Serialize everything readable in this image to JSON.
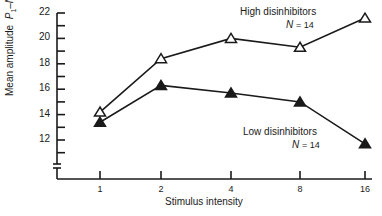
{
  "chart_data": {
    "type": "line",
    "title": "",
    "xlabel": "Stimulus intensity",
    "ylabel": "Mean amplitude P1–N1",
    "ylabel_parts": {
      "main": "Mean amplitude",
      "p": "P",
      "p_sub": "1",
      "dash": "–",
      "n": "N",
      "n_sub": "1"
    },
    "x": [
      "1",
      "2",
      "4",
      "8",
      "16"
    ],
    "x_scale": "log2",
    "y_ticks": [
      "12",
      "14",
      "16",
      "18",
      "20",
      "22"
    ],
    "ylim": [
      10,
      22
    ],
    "y_axis_break": true,
    "grid": false,
    "series": [
      {
        "name": "High disinhibitors",
        "n_label": "N",
        "n_value": "= 14",
        "marker": "open-triangle",
        "values": [
          14.2,
          18.4,
          20.0,
          19.3,
          21.6
        ]
      },
      {
        "name": "Low disinhibitors",
        "n_label": "N",
        "n_value": "= 14",
        "marker": "filled-triangle",
        "values": [
          13.4,
          16.3,
          15.7,
          15.0,
          11.7
        ]
      }
    ],
    "legend": "inline annotations near series ends"
  }
}
